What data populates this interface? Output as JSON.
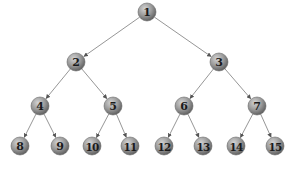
{
  "diagram": {
    "type": "binary-tree",
    "width": 292,
    "height": 170,
    "node_radius": 9,
    "colors": {
      "node_light": "#d4d4d4",
      "node_mid": "#9a9a9a",
      "node_dark": "#5e5e5e",
      "node_stroke": "#6a6a6a",
      "edge": "#8a8a8a",
      "label": "#1a1a1a"
    },
    "nodes": [
      {
        "id": 1,
        "label": "1",
        "x": 147,
        "y": 12
      },
      {
        "id": 2,
        "label": "2",
        "x": 76,
        "y": 62
      },
      {
        "id": 3,
        "label": "3",
        "x": 219,
        "y": 62
      },
      {
        "id": 4,
        "label": "4",
        "x": 40,
        "y": 106
      },
      {
        "id": 5,
        "label": "5",
        "x": 113,
        "y": 106
      },
      {
        "id": 6,
        "label": "6",
        "x": 184,
        "y": 106
      },
      {
        "id": 7,
        "label": "7",
        "x": 257,
        "y": 106
      },
      {
        "id": 8,
        "label": "8",
        "x": 20,
        "y": 146
      },
      {
        "id": 9,
        "label": "9",
        "x": 60,
        "y": 146
      },
      {
        "id": 10,
        "label": "10",
        "x": 92,
        "y": 146
      },
      {
        "id": 11,
        "label": "11",
        "x": 130,
        "y": 146
      },
      {
        "id": 12,
        "label": "12",
        "x": 164,
        "y": 146
      },
      {
        "id": 13,
        "label": "13",
        "x": 203,
        "y": 146
      },
      {
        "id": 14,
        "label": "14",
        "x": 236,
        "y": 146
      },
      {
        "id": 15,
        "label": "15",
        "x": 275,
        "y": 146
      }
    ],
    "edges": [
      {
        "from": 1,
        "to": 2
      },
      {
        "from": 1,
        "to": 3
      },
      {
        "from": 2,
        "to": 4
      },
      {
        "from": 2,
        "to": 5
      },
      {
        "from": 3,
        "to": 6
      },
      {
        "from": 3,
        "to": 7
      },
      {
        "from": 4,
        "to": 8
      },
      {
        "from": 4,
        "to": 9
      },
      {
        "from": 5,
        "to": 10
      },
      {
        "from": 5,
        "to": 11
      },
      {
        "from": 6,
        "to": 12
      },
      {
        "from": 6,
        "to": 13
      },
      {
        "from": 7,
        "to": 14
      },
      {
        "from": 7,
        "to": 15
      }
    ]
  }
}
